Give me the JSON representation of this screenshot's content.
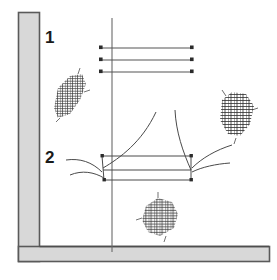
{
  "figure": {
    "type": "patent-style-diagram",
    "width": 277,
    "height": 280,
    "background_color": "#ffffff",
    "line_color": "#4a4a4a",
    "dark_line_color": "#333333"
  },
  "frame": {
    "name": "L-shaped gray frame",
    "fill_color": "#d8d8d8",
    "edge_color": "#5a5a5a",
    "vertical_bar": {
      "x": 18,
      "y": 12,
      "width": 22,
      "height": 250
    },
    "horizontal_bar": {
      "x": 18,
      "y": 246,
      "width": 252,
      "height": 16
    }
  },
  "callouts": [
    {
      "id": "1",
      "label": "1",
      "x": 45,
      "y": 29
    },
    {
      "id": "2",
      "label": "2",
      "x": 45,
      "y": 149
    }
  ],
  "axis": {
    "name": "vertical-center-line",
    "x": 112,
    "y_top": 18,
    "y_bottom": 252,
    "color": "#6a6a6a"
  },
  "horizontal_lines": [
    {
      "index": 1,
      "y": 48,
      "x_start": 100,
      "x_end": 192,
      "marker": "square"
    },
    {
      "index": 2,
      "y": 60,
      "x_start": 100,
      "x_end": 192,
      "marker": "square"
    },
    {
      "index": 3,
      "y": 72,
      "x_start": 100,
      "x_end": 192,
      "marker": "square"
    }
  ],
  "box": {
    "name": "trapezoid-element",
    "top_left": {
      "x": 102,
      "y": 156
    },
    "top_right": {
      "x": 191,
      "y": 156
    },
    "bottom_left": {
      "x": 104,
      "y": 180
    },
    "bottom_right": {
      "x": 191,
      "y": 180
    },
    "mid_left": {
      "x": 103,
      "y": 170
    },
    "mid_right": {
      "x": 191,
      "y": 170
    },
    "corner_marker": "square"
  },
  "leader_curves": [
    {
      "id": "left-ascending",
      "from": "box-top-left",
      "to": "upper-middle"
    },
    {
      "id": "right-ascending",
      "from": "box-top-right",
      "to": "upper-middle"
    },
    {
      "id": "callout-2-upper",
      "from": "callout-2",
      "to": "box-left-corner"
    },
    {
      "id": "callout-2-lower",
      "from": "callout-2",
      "to": "box-left-corner"
    },
    {
      "id": "right-upper-leader",
      "from": "right-patch",
      "to": "box-right-corner"
    },
    {
      "id": "right-lower-leader",
      "from": "right-patch",
      "to": "box-right-corner"
    }
  ],
  "hatch_patches": [
    {
      "id": "left-patch",
      "x": 52,
      "y": 74,
      "width": 36,
      "height": 46,
      "description": "cross-hatched obscured annotation"
    },
    {
      "id": "right-patch",
      "x": 216,
      "y": 92,
      "width": 42,
      "height": 48,
      "description": "cross-hatched obscured annotation"
    },
    {
      "id": "bottom-patch",
      "x": 140,
      "y": 198,
      "width": 42,
      "height": 42,
      "description": "cross-hatched obscured annotation"
    }
  ]
}
